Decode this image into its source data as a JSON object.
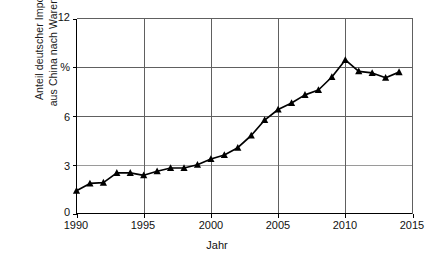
{
  "chart_data": {
    "type": "line",
    "title": "",
    "xlabel": "Jahr",
    "ylabel": "Anteil deutscher Importe aus China nach Warenwert",
    "ylabel_line1": "Anteil deutscher Importe",
    "ylabel_line2": "aus China nach Warenwert",
    "yunit": "%",
    "xlim": [
      1990,
      2015
    ],
    "ylim": [
      0,
      12
    ],
    "xticks": [
      1990,
      1995,
      2000,
      2005,
      2010,
      2015
    ],
    "xtick_labels": [
      "1990",
      "1995",
      "2000",
      "2005",
      "2010",
      "2015"
    ],
    "yticks": [
      0,
      3,
      6,
      9,
      12
    ],
    "ytick_labels": [
      "0",
      "3",
      "6",
      "%",
      "12"
    ],
    "grid": true,
    "legend": "none",
    "marker": "triangle",
    "line_color": "#000000",
    "grid_color": "#888888",
    "axis_color": "#000000",
    "x": [
      1990,
      1991,
      1992,
      1993,
      1994,
      1995,
      1996,
      1997,
      1998,
      1999,
      2000,
      2001,
      2002,
      2003,
      2004,
      2005,
      2006,
      2007,
      2008,
      2009,
      2010,
      2011,
      2012,
      2013,
      2014
    ],
    "values": [
      1.4,
      1.85,
      1.9,
      2.5,
      2.5,
      2.35,
      2.6,
      2.8,
      2.8,
      3.0,
      3.35,
      3.6,
      4.05,
      4.8,
      5.75,
      6.4,
      6.8,
      7.3,
      7.6,
      8.4,
      9.45,
      8.75,
      8.65,
      8.35,
      8.7
    ]
  }
}
